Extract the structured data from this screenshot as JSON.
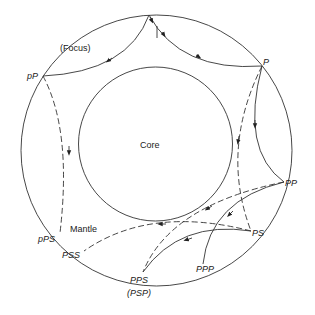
{
  "diagram": {
    "regions": {
      "core": "Core",
      "mantle": "Mantle"
    },
    "focus_label": "(Focus)",
    "phases": {
      "P": "P",
      "pP": "pP",
      "PP": "PP",
      "PS": "PS",
      "pPS": "pPS",
      "PSS": "PSS",
      "PPS": "PPS",
      "PSP": "(PSP)",
      "PPP": "PPP"
    },
    "legend_hint": {
      "solid": "P-wave path",
      "dashed": "S-wave path"
    },
    "colors": {
      "line": "#333333",
      "background": "#ffffff"
    }
  }
}
